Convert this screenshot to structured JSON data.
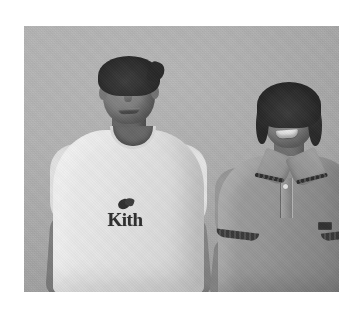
{
  "page": {
    "background_color": "#ffffff",
    "width": 362,
    "height": 318
  },
  "photo": {
    "alt_text": "Two people standing side by side in front of a plain wall",
    "style": "grayscale photograph",
    "frame": {
      "left": 24,
      "top": 26,
      "width": 315,
      "height": 266
    },
    "background": {
      "name": "plain interior wall",
      "color": "#b2b2b2"
    },
    "subjects": [
      {
        "id": "man-left",
        "position": "left",
        "pose": "standing, facing camera, smiling",
        "hair": "short dark hair",
        "hair_color": "#2d2a28",
        "skin_color": "#8a7e73",
        "garment": {
          "type": "crew-neck t-shirt",
          "color": "#f0efec",
          "color_name": "white",
          "graphic": {
            "wordmark": "Kith",
            "symbol": "butterfly-icon",
            "text_color": "#2b2927"
          }
        }
      },
      {
        "id": "woman-right",
        "position": "right",
        "pose": "standing, facing camera, smiling",
        "hair": "dark hair pulled back",
        "hair_color": "#2b2826",
        "skin_color": "#907f74",
        "garment": {
          "type": "polo shirt",
          "color": "#9c958c",
          "color_name": "gray",
          "details": [
            "striped collar trim",
            "striped sleeve cuffs",
            "two-button placket",
            "chest logo patch"
          ],
          "trim_color": "#2e2b28",
          "button_color": "#ece8e2"
        }
      }
    ]
  }
}
